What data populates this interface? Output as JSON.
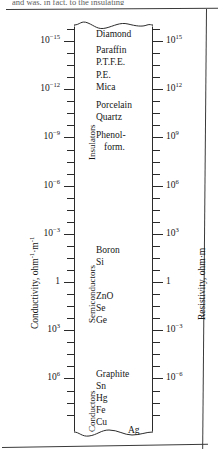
{
  "page": {
    "cropped_header_text": "and  was,  in  fact,  to  the  insulating"
  },
  "chart_data": {
    "type": "table",
    "title": "",
    "left_axis": {
      "label": "Conductivity, ohm⁻¹·m⁻¹",
      "label_text": "Conductivity, ohm",
      "label_sup1": "-1",
      "label_mid": "·m",
      "label_sup2": "-1",
      "ticks": [
        "10-15",
        "10-12",
        "10-9",
        "10-6",
        "10-3",
        "1",
        "103",
        "106"
      ],
      "tick_labels": [
        {
          "base": "10",
          "exp": "−15"
        },
        {
          "base": "10",
          "exp": "−12"
        },
        {
          "base": "10",
          "exp": "−9"
        },
        {
          "base": "10",
          "exp": "−6"
        },
        {
          "base": "10",
          "exp": "−3"
        },
        {
          "base": "1",
          "exp": ""
        },
        {
          "base": "10",
          "exp": "3"
        },
        {
          "base": "10",
          "exp": "6"
        }
      ]
    },
    "right_axis": {
      "label": "Resistivity, ohm·m",
      "ticks": [
        "1015",
        "1012",
        "109",
        "106",
        "103",
        "1",
        "10-3",
        "10-6"
      ],
      "tick_labels": [
        {
          "base": "10",
          "exp": "15"
        },
        {
          "base": "10",
          "exp": "12"
        },
        {
          "base": "10",
          "exp": "9"
        },
        {
          "base": "10",
          "exp": "6"
        },
        {
          "base": "10",
          "exp": "3"
        },
        {
          "base": "1",
          "exp": ""
        },
        {
          "base": "10",
          "exp": "−3"
        },
        {
          "base": "10",
          "exp": "−6"
        }
      ]
    },
    "bands": [
      {
        "name": "Insulators",
        "top": 30,
        "height": 130
      },
      {
        "name": "Semiconductors",
        "top": 215,
        "height": 108
      },
      {
        "name": "Conductors",
        "top": 364,
        "height": 68
      }
    ],
    "materials": [
      {
        "name": "Diamond",
        "top": 30
      },
      {
        "name": "Paraffin",
        "top": 46
      },
      {
        "name": "P.T.F.E.",
        "top": 58
      },
      {
        "name": "P.E.",
        "top": 71
      },
      {
        "name": "Mica",
        "top": 83
      },
      {
        "name": "Porcelain",
        "top": 101
      },
      {
        "name": "Quartz",
        "top": 113
      },
      {
        "name": "Phenol-",
        "top": 131
      },
      {
        "name": "form.",
        "top": 143,
        "indent": 8
      },
      {
        "name": "Boron",
        "top": 246
      },
      {
        "name": "Si",
        "top": 258
      },
      {
        "name": "ZnO",
        "top": 292
      },
      {
        "name": "Se",
        "top": 304
      },
      {
        "name": "Ge",
        "top": 316
      },
      {
        "name": "Graphite",
        "top": 370
      },
      {
        "name": "Sn",
        "top": 382
      },
      {
        "name": "Hg",
        "top": 394
      },
      {
        "name": "Fe",
        "top": 406
      },
      {
        "name": "Cu",
        "top": 418
      },
      {
        "name": "Ag",
        "top": 426,
        "indent": 32
      }
    ]
  }
}
